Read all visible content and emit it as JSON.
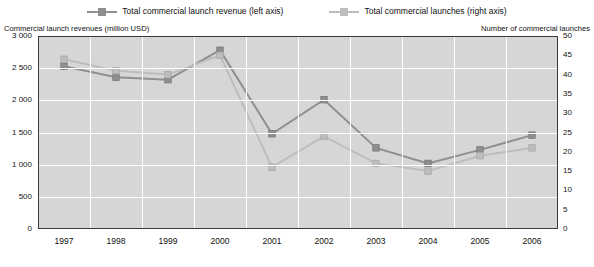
{
  "legend": {
    "items": [
      {
        "label": "Total commercial launch revenue (left axis)",
        "color": "#8f8f8f",
        "marker": "square"
      },
      {
        "label": "Total commercial launches (right axis)",
        "color": "#bdbdbd",
        "marker": "square"
      }
    ]
  },
  "axis_titles": {
    "left": "Commercial launch revenues (million USD)",
    "right": "Number of commercial launches"
  },
  "ticks": {
    "y_left": [
      "3 000",
      "2 500",
      "2 000",
      "1 500",
      "1 000",
      "500",
      "0"
    ],
    "y_right": [
      "50",
      "45",
      "40",
      "35",
      "30",
      "25",
      "20",
      "15",
      "10",
      "5",
      "0"
    ],
    "x": [
      "1997",
      "1998",
      "1999",
      "2000",
      "2001",
      "2002",
      "2003",
      "2004",
      "2005",
      "2006"
    ]
  },
  "chart_data": {
    "type": "line",
    "title": "",
    "xlabel": "",
    "ylabel": "Commercial launch revenues (million USD)",
    "y2label": "Number of commercial launches",
    "categories": [
      "1997",
      "1998",
      "1999",
      "2000",
      "2001",
      "2002",
      "2003",
      "2004",
      "2005",
      "2006"
    ],
    "ylim": [
      0,
      3000
    ],
    "y2lim": [
      0,
      50
    ],
    "grid": true,
    "legend_position": "top",
    "series": [
      {
        "name": "Total commercial launch revenue (left axis)",
        "axis": "left",
        "color": "#8f8f8f",
        "marker": "square",
        "values": [
          2530,
          2360,
          2320,
          2780,
          1480,
          2010,
          1260,
          1020,
          1230,
          1460
        ]
      },
      {
        "name": "Total commercial launches (right axis)",
        "axis": "right",
        "color": "#bdbdbd",
        "marker": "square",
        "values": [
          44,
          41,
          40,
          45,
          16,
          24,
          17,
          15,
          19,
          21
        ]
      }
    ]
  }
}
